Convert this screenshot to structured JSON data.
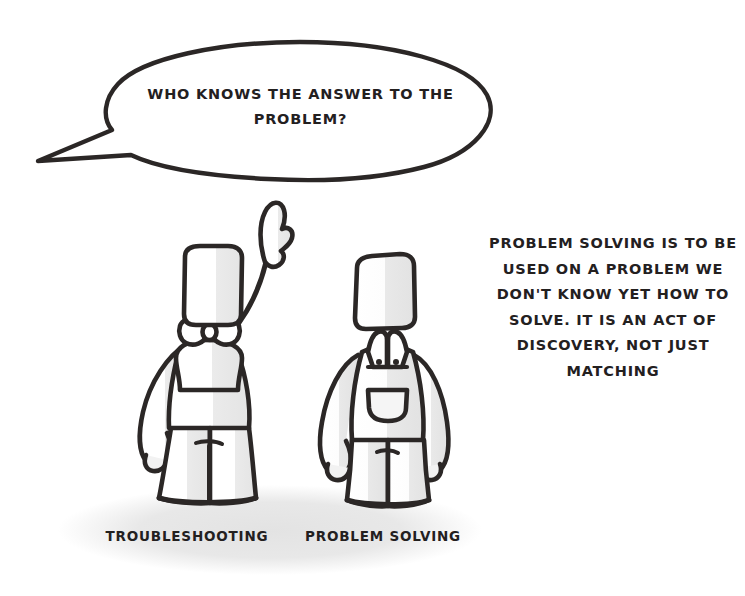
{
  "canvas": {
    "width": 745,
    "height": 596,
    "background_color": "#ffffff",
    "ink_color": "#2b2726",
    "shade_color": "#e9e9e9",
    "ground_shadow_color": "#e8e8e8"
  },
  "speech_bubble": {
    "text": "WHO KNOWS THE ANSWER TO THE PROBLEM?",
    "line_1": "WHO KNOWS THE ANSWER TO THE",
    "line_2": "PROBLEM?",
    "tail_direction": "lower-left"
  },
  "side_note": {
    "text": "PROBLEM SOLVING IS TO BE USED ON A PROBLEM WE DON'T KNOW YET HOW TO SOLVE. IT IS AN ACT OF DISCOVERY, NOT JUST MATCHING",
    "line_1": "PROBLEM SOLVING IS TO BE",
    "line_2": "USED ON A PROBLEM WE",
    "line_3": "DON'T KNOW YET HOW TO",
    "line_4": "SOLVE. IT IS AN ACT OF",
    "line_5": "DISCOVERY, NOT JUST",
    "line_6": "MATCHING"
  },
  "figures": [
    {
      "id": "left",
      "label": "TROUBLESHOOTING",
      "outfit": "bow-tie",
      "pose": "right-arm-raised-pointing",
      "head_shape": "tall-rectangle"
    },
    {
      "id": "right",
      "label": "PROBLEM SOLVING",
      "outfit": "overalls-with-bib-pocket",
      "pose": "both-arms-down",
      "head_shape": "tall-rectangle"
    }
  ],
  "ground": {
    "shape": "ellipse",
    "label": "ground-shadow"
  }
}
